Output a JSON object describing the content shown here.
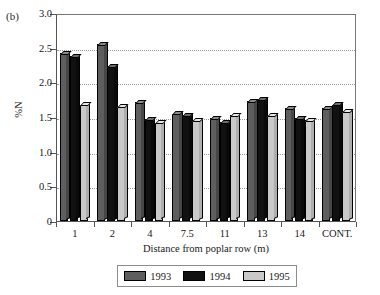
{
  "figure": {
    "panel_label": "(b)"
  },
  "chart_data": {
    "type": "bar",
    "title": "",
    "xlabel": "Distance from poplar row (m)",
    "ylabel": "%N",
    "categories": [
      "1",
      "2",
      "4",
      "7.5",
      "11",
      "13",
      "14",
      "CONT."
    ],
    "series": [
      {
        "name": "1993",
        "color": "#5e5e5e",
        "values": [
          2.42,
          2.55,
          1.72,
          1.55,
          1.48,
          1.73,
          1.63,
          1.63
        ]
      },
      {
        "name": "1994",
        "color": "#111111",
        "values": [
          2.38,
          2.23,
          1.47,
          1.53,
          1.43,
          1.76,
          1.48,
          1.68
        ]
      },
      {
        "name": "1995",
        "color": "#c9c9c9",
        "values": [
          1.68,
          1.65,
          1.42,
          1.45,
          1.53,
          1.52,
          1.45,
          1.58
        ]
      }
    ],
    "ylim": [
      0,
      3.0
    ],
    "yticks": [
      0,
      0.5,
      1.0,
      1.5,
      2.0,
      2.5,
      3.0
    ],
    "ytick_labels": [
      "0",
      "0.5",
      "1.0",
      "1.5",
      "2.0",
      "2.5",
      "3.0"
    ],
    "grid": true,
    "grid_axis": "y",
    "legend_position": "bottom",
    "legend_entries": [
      "1993",
      "1994",
      "1995"
    ]
  }
}
